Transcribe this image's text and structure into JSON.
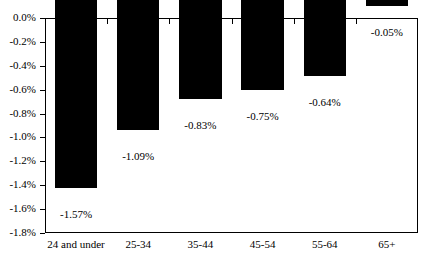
{
  "chart_data": {
    "type": "bar",
    "title": "",
    "title_clipped": true,
    "xlabel": "",
    "ylabel": "",
    "categories": [
      "24 and under",
      "25-34",
      "35-44",
      "45-54",
      "55-64",
      "65+"
    ],
    "values": [
      -1.57,
      -1.09,
      -0.83,
      -0.75,
      -0.64,
      -0.05
    ],
    "value_labels": [
      "-1.57%",
      "-1.09%",
      "-0.83%",
      "-0.75%",
      "-0.64%",
      "-0.05%"
    ],
    "ylim": [
      -1.8,
      0.0
    ],
    "ytick_labels": [
      "0.0%",
      "-0.2%",
      "-0.4%",
      "-0.6%",
      "-0.8%",
      "-1.0%",
      "-1.2%",
      "-1.4%",
      "-1.6%",
      "-1.8%"
    ],
    "ytick_values": [
      0.0,
      -0.2,
      -0.4,
      -0.6,
      -0.8,
      -1.0,
      -1.2,
      -1.4,
      -1.6,
      -1.8
    ],
    "grid": false,
    "legend": false,
    "bar_color": "#000000",
    "axis_color": "#000000",
    "background_color": "#ffffff"
  }
}
